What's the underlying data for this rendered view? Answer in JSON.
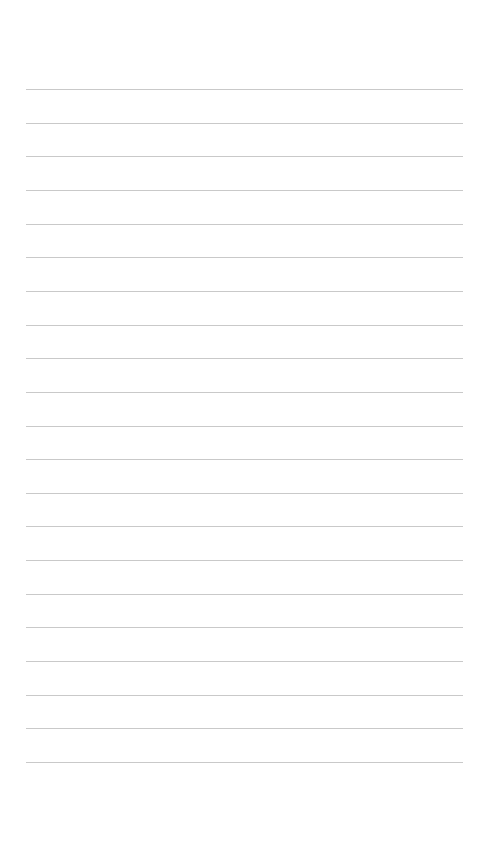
{
  "page": {
    "type": "lined-paper",
    "background": "#ffffff",
    "rule_color": "#c9c9c9",
    "rule_count": 21,
    "rule_start_y": 89,
    "rule_spacing": 33.65,
    "rule_left": 26,
    "rule_width": 437
  }
}
